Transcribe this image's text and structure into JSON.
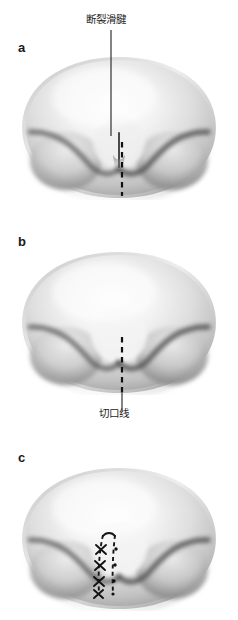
{
  "figure": {
    "type": "medical-illustration",
    "background_color": "#ffffff",
    "ink_color": "#1a1a1a",
    "body_fill_light": "#fbfbfb",
    "body_fill_mid": "#d9d9d9",
    "body_fill_dark": "#8f8f8f",
    "groove_shadow": "#4a4a4a",
    "panels": [
      {
        "id": "a",
        "letter": "a",
        "annotation": {
          "text": "断裂滑腱",
          "position": "top",
          "has_leader_line": true
        },
        "has_dashed_incision_line": true,
        "has_sutures": false
      },
      {
        "id": "b",
        "letter": "b",
        "annotation": {
          "text": "切口线",
          "position": "bottom",
          "has_leader_line": true
        },
        "has_dashed_incision_line": true,
        "has_sutures": false
      },
      {
        "id": "c",
        "letter": "c",
        "annotation": null,
        "has_dashed_incision_line": true,
        "has_sutures": true,
        "suture_count": 4,
        "suture_glyph": "X"
      }
    ],
    "bottom_caption": ""
  }
}
